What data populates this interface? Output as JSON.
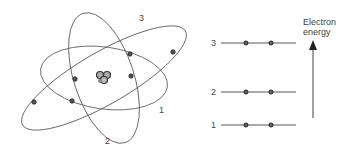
{
  "atom": {
    "orbit_labels": [
      "1",
      "2",
      "3"
    ],
    "nucleus": "nucleus"
  },
  "energy_levels": {
    "axis_label_line1": "Electron",
    "axis_label_line2": "energy",
    "levels": [
      {
        "label": "3",
        "electrons": 2
      },
      {
        "label": "2",
        "electrons": 2
      },
      {
        "label": "1",
        "electrons": 2
      }
    ]
  },
  "colors": {
    "line": "#444444",
    "electron": "#333333"
  }
}
